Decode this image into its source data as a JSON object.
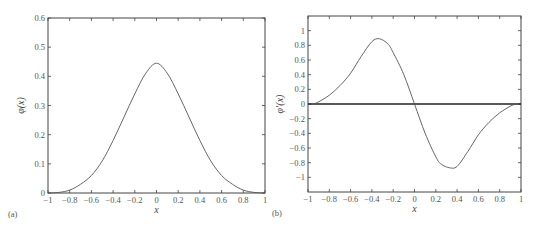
{
  "chart_data": [
    {
      "type": "line",
      "panel": "(a)",
      "title": "",
      "xlabel": "x",
      "ylabel": "φ(x)",
      "xlim": [
        -1,
        1
      ],
      "ylim": [
        0,
        0.6
      ],
      "xticks": [
        "-1",
        "-0.8",
        "-0.6",
        "-0.4",
        "-0.2",
        "0",
        "0.2",
        "0.4",
        "0.6",
        "0.8",
        "1"
      ],
      "yticks": [
        "0",
        "0.1",
        "0.2",
        "0.3",
        "0.4",
        "0.5",
        "0.6"
      ],
      "grid": false,
      "series": [
        {
          "name": "phi",
          "x": [
            -1,
            -0.9,
            -0.8,
            -0.7,
            -0.6,
            -0.5,
            -0.4,
            -0.3,
            -0.2,
            -0.1,
            0,
            0.1,
            0.2,
            0.3,
            0.4,
            0.5,
            0.6,
            0.7,
            0.8,
            0.9,
            1
          ],
          "y": [
            0,
            0.002,
            0.01,
            0.03,
            0.06,
            0.11,
            0.18,
            0.26,
            0.34,
            0.41,
            0.445,
            0.41,
            0.34,
            0.26,
            0.18,
            0.11,
            0.06,
            0.03,
            0.01,
            0.002,
            0
          ]
        }
      ]
    },
    {
      "type": "line",
      "panel": "(b)",
      "title": "",
      "xlabel": "x",
      "ylabel": "φ′(x)",
      "xlim": [
        -1,
        1
      ],
      "ylim": [
        -1.2,
        1.2
      ],
      "xticks": [
        "-1",
        "-0.8",
        "-0.6",
        "-0.4",
        "-0.2",
        "0",
        "0.2",
        "0.4",
        "0.6",
        "0.8",
        "1"
      ],
      "yticks": [
        "-1",
        "-0.8",
        "-0.6",
        "-0.4",
        "-0.2",
        "0",
        "0.2",
        "0.4",
        "0.6",
        "0.8",
        "1"
      ],
      "grid": false,
      "annotations": [
        "horizontal line at y=0"
      ],
      "series": [
        {
          "name": "dphi",
          "x": [
            -0.95,
            -0.9,
            -0.8,
            -0.7,
            -0.6,
            -0.5,
            -0.4,
            -0.33,
            -0.25,
            -0.2,
            -0.1,
            0,
            0.1,
            0.2,
            0.25,
            0.33,
            0.4,
            0.5,
            0.6,
            0.7,
            0.8,
            0.9,
            0.95
          ],
          "y": [
            0,
            0.03,
            0.12,
            0.25,
            0.42,
            0.65,
            0.85,
            0.89,
            0.82,
            0.7,
            0.4,
            0,
            -0.4,
            -0.72,
            -0.82,
            -0.87,
            -0.85,
            -0.65,
            -0.42,
            -0.25,
            -0.12,
            -0.03,
            0
          ]
        }
      ]
    }
  ],
  "panels": {
    "a": {
      "label": "(a)",
      "xlabel": "x",
      "ylabel": "φ(x)"
    },
    "b": {
      "label": "(b)",
      "xlabel": "x",
      "ylabel": "φ′(x)"
    }
  },
  "colors": {
    "curve": "#555555",
    "frame": "#444444",
    "zero_line": "#222222"
  }
}
